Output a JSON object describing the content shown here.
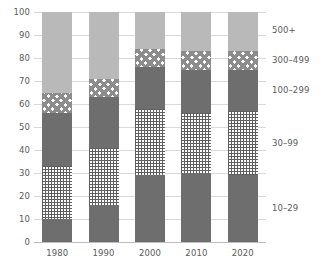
{
  "chart_data": {
    "type": "bar",
    "stacked": true,
    "title": "",
    "subtitle": "",
    "xlabel": "",
    "ylabel": "",
    "categories": [
      "1980",
      "1990",
      "2000",
      "2010",
      "2020"
    ],
    "ylim": [
      0,
      100
    ],
    "yticks": [
      0,
      10,
      20,
      30,
      40,
      50,
      60,
      70,
      80,
      90,
      100
    ],
    "ytick_labels": [
      "0",
      "10",
      "20",
      "30",
      "40",
      "50",
      "60",
      "70",
      "80",
      "90",
      "100"
    ],
    "grid": true,
    "legend_position": "right-outside-aligned-to-stacks",
    "series": [
      {
        "name": "10-29",
        "label": "10–29",
        "fill": "solid-dark",
        "color": "#6e6e6e",
        "values": [
          10,
          16,
          29,
          30,
          29
        ]
      },
      {
        "name": "30-99",
        "label": "30–99",
        "fill": "grid-fine",
        "color": "#5f5f5f",
        "values": [
          23,
          25,
          29,
          26,
          28
        ]
      },
      {
        "name": "100-299",
        "label": "100–299",
        "fill": "solid-mid",
        "color": "#6e6e6e",
        "values": [
          23,
          22,
          18,
          19,
          18
        ]
      },
      {
        "name": "300-499",
        "label": "300–499",
        "fill": "check",
        "color": "#8c8c8c",
        "values": [
          9,
          8,
          8,
          8,
          8
        ]
      },
      {
        "name": "500+",
        "label": "500+",
        "fill": "solid-light",
        "color": "#b9b9b9",
        "values": [
          35,
          29,
          16,
          17,
          17
        ]
      }
    ],
    "legend_entries": [
      {
        "label": "500+",
        "value_position": 92
      },
      {
        "label": "300–499",
        "value_position": 79
      },
      {
        "label": "100–299",
        "value_position": 66
      },
      {
        "label": "30–99",
        "value_position": 43
      },
      {
        "label": "10–29",
        "value_position": 15
      }
    ]
  }
}
